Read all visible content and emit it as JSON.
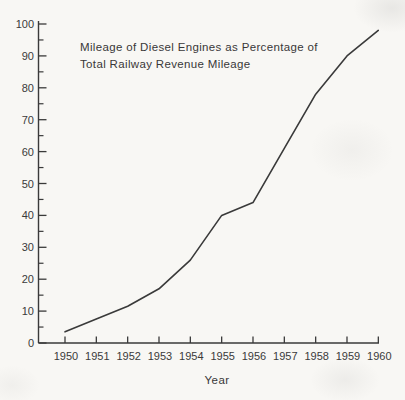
{
  "page": {
    "background_color": "#f8f7f4",
    "ink_color": "#3a3a3a"
  },
  "chart_data": {
    "type": "line",
    "title": "Mileage of Diesel Engines as Percentage of Total Railway Revenue Mileage",
    "title_lines": [
      "Mileage of Diesel Engines as Percentage of",
      "Total Railway Revenue Mileage"
    ],
    "xlabel": "Year",
    "ylabel": "",
    "categories": [
      "1950",
      "1951",
      "1952",
      "1953",
      "1954",
      "1955",
      "1956",
      "1957",
      "1958",
      "1959",
      "1960"
    ],
    "values": [
      3.5,
      7.5,
      11.5,
      17,
      26,
      40,
      44,
      61,
      78,
      90,
      98
    ],
    "y_tick_labels": [
      "0",
      "10",
      "20",
      "30",
      "40",
      "50",
      "60",
      "70",
      "80",
      "90",
      "100"
    ],
    "ylim": [
      0,
      100
    ],
    "y_major_tick_step": 10,
    "y_minor_tick_step": 5,
    "grid": false,
    "legend_position": "none",
    "line_color": "#3a3a3a",
    "axis_color": "#3a3a3a"
  }
}
